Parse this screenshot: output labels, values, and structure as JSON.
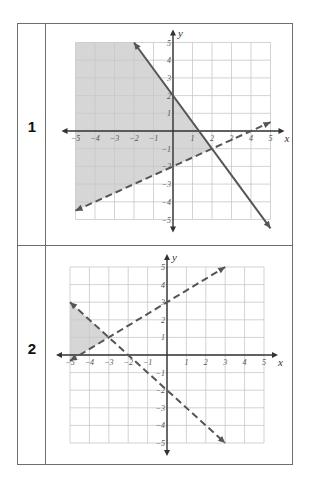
{
  "rows": [
    {
      "label": "1"
    },
    {
      "label": "2"
    }
  ],
  "colors": {
    "border": "#6e6e6e",
    "grid": "#c8c8c8",
    "axis": "#333333",
    "line": "#555555",
    "shade": "#d6d6d6"
  },
  "chart_data": [
    {
      "type": "line",
      "title": "Graph 1 - system of linear inequalities",
      "xlabel": "x",
      "ylabel": "y",
      "xlim": [
        -5,
        5
      ],
      "ylim": [
        -5,
        5
      ],
      "grid": true,
      "x_ticks": [
        "-5",
        "-4",
        "-3",
        "-2",
        "-1",
        "1",
        "2",
        "3",
        "4",
        "5"
      ],
      "y_ticks": [
        "5",
        "4",
        "3",
        "2",
        "1",
        "-1",
        "-2",
        "-3",
        "-4",
        "-5"
      ],
      "series": [
        {
          "name": "solid boundary",
          "style": "solid",
          "equation": "y = -3/2 x + 2",
          "points": [
            [
              -2,
              5
            ],
            [
              5,
              -5.5
            ]
          ]
        },
        {
          "name": "dashed boundary",
          "style": "dashed",
          "equation": "y = 1/2 x - 2",
          "points": [
            [
              -5,
              -4.5
            ],
            [
              5,
              0.5
            ]
          ]
        }
      ],
      "shaded_region": {
        "description": "left of/below solid line and above dashed line, x >= -5",
        "vertices": [
          [
            -5,
            5
          ],
          [
            -2,
            5
          ],
          [
            2,
            -1
          ],
          [
            -5,
            -4.5
          ]
        ]
      },
      "intersection": [
        2,
        -1
      ]
    },
    {
      "type": "line",
      "title": "Graph 2 - system of linear inequalities",
      "xlabel": "x",
      "ylabel": "y",
      "xlim": [
        -5,
        5
      ],
      "ylim": [
        -5,
        5
      ],
      "grid": true,
      "x_ticks": [
        "-5",
        "-4",
        "-3",
        "-2",
        "-1",
        "1",
        "2",
        "3",
        "4",
        "5"
      ],
      "y_ticks": [
        "5",
        "4",
        "3",
        "2",
        "1",
        "-1",
        "-2",
        "-3",
        "-4",
        "-5"
      ],
      "series": [
        {
          "name": "dashed boundary A",
          "style": "dashed",
          "equation": "y = 2/3 x + 3",
          "points": [
            [
              -5,
              -0.33
            ],
            [
              3,
              5
            ]
          ]
        },
        {
          "name": "dashed boundary B",
          "style": "dashed",
          "equation": "y = -x - 2",
          "points": [
            [
              -5,
              3
            ],
            [
              3,
              -5
            ]
          ]
        }
      ],
      "shaded_region": {
        "description": "triangle bounded by both dashed lines and x = -5",
        "vertices": [
          [
            -5,
            3
          ],
          [
            -3,
            1
          ],
          [
            -5,
            -0.33
          ]
        ]
      },
      "intersection": [
        -3,
        1
      ]
    }
  ]
}
